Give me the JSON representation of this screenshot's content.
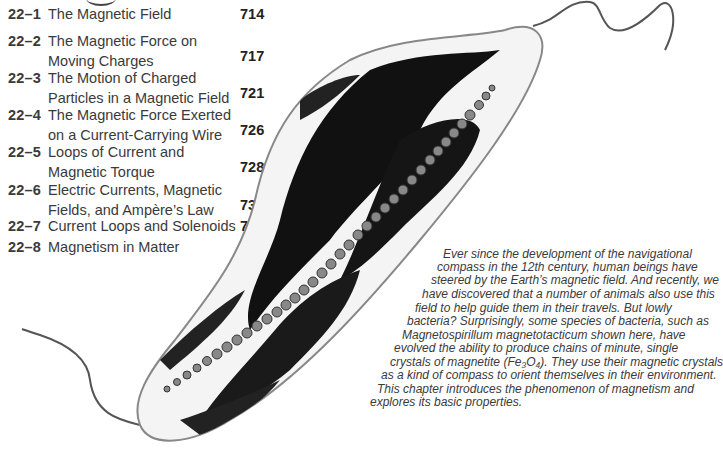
{
  "chapter_toc": {
    "items": [
      {
        "number": "22–1",
        "title": "The Magnetic Field",
        "page": "714"
      },
      {
        "number": "22–2",
        "title": "The Magnetic Force on Moving Charges",
        "page": "717"
      },
      {
        "number": "22–3",
        "title": "The Motion of Charged Particles in a Magnetic Field",
        "page": "721"
      },
      {
        "number": "22–4",
        "title": "The Magnetic Force Exerted on a Current-Carrying Wire",
        "page": "726"
      },
      {
        "number": "22–5",
        "title": "Loops of Current and Magnetic Torque",
        "page": "728"
      },
      {
        "number": "22–6",
        "title": "Electric Currents, Magnetic Fields, and Ampère’s Law",
        "page": "730"
      },
      {
        "number": "22–7",
        "title": "Current Loops and Solenoids",
        "page": "734"
      },
      {
        "number": "22–8",
        "title": "Magnetism in Matter",
        "page": "737"
      }
    ]
  },
  "figure": {
    "icon": "bacterium-illustration"
  },
  "intro": {
    "lines": [
      "Ever since the development of the navigational",
      "compass in the 12th century, human beings have",
      "steered by the Earth’s magnetic field. And recently, we",
      "have discovered that a number of animals also use this",
      "field to help guide them in their travels. But lowly",
      "bacteria? Surprisingly, some species of bacteria, such as",
      "Magnetospirillum magnetotacticum shown here, have",
      "evolved the ability to produce chains of minute, single",
      "crystals of magnetite (Fe₃O₄). They use their magnetic crystals",
      "as a kind of compass to orient themselves in their environment.",
      "This chapter introduces the phenomenon of magnetism and",
      "explores its basic properties."
    ]
  }
}
